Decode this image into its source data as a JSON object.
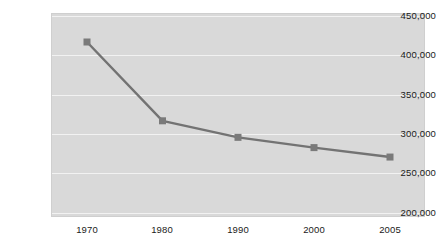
{
  "chart_data": {
    "type": "line",
    "title": "",
    "subtitle": "",
    "xlabel": "",
    "ylabel": "",
    "categories": [
      "1970",
      "1980",
      "1990",
      "2000",
      "2005"
    ],
    "values": [
      417000,
      317000,
      296000,
      283000,
      271000
    ],
    "series": [
      {
        "name": "",
        "values": [
          417000,
          317000,
          296000,
          283000,
          271000
        ]
      }
    ],
    "ylim": [
      200000,
      450000
    ],
    "y_ticks": [
      450000,
      400000,
      350000,
      300000,
      250000,
      200000
    ],
    "y_tick_labels": [
      "450,000",
      "400,000",
      "350,000",
      "300,000",
      "250,000",
      "200,000"
    ],
    "x_tick_labels": [
      "1970",
      "1980",
      "1990",
      "2000",
      "2005"
    ],
    "grid": true,
    "grid_axis": "y",
    "legend": false,
    "legend_position": "none",
    "marker": "square",
    "colors": {
      "line": "#737373",
      "marker": "#7a7a7a",
      "plot_background": "#d9d9d9",
      "gridline": "#f2f2f2",
      "figure_background": "#ffffff",
      "tick_label": "#1a1a1a",
      "plot_border": "#cfcfcf"
    }
  }
}
